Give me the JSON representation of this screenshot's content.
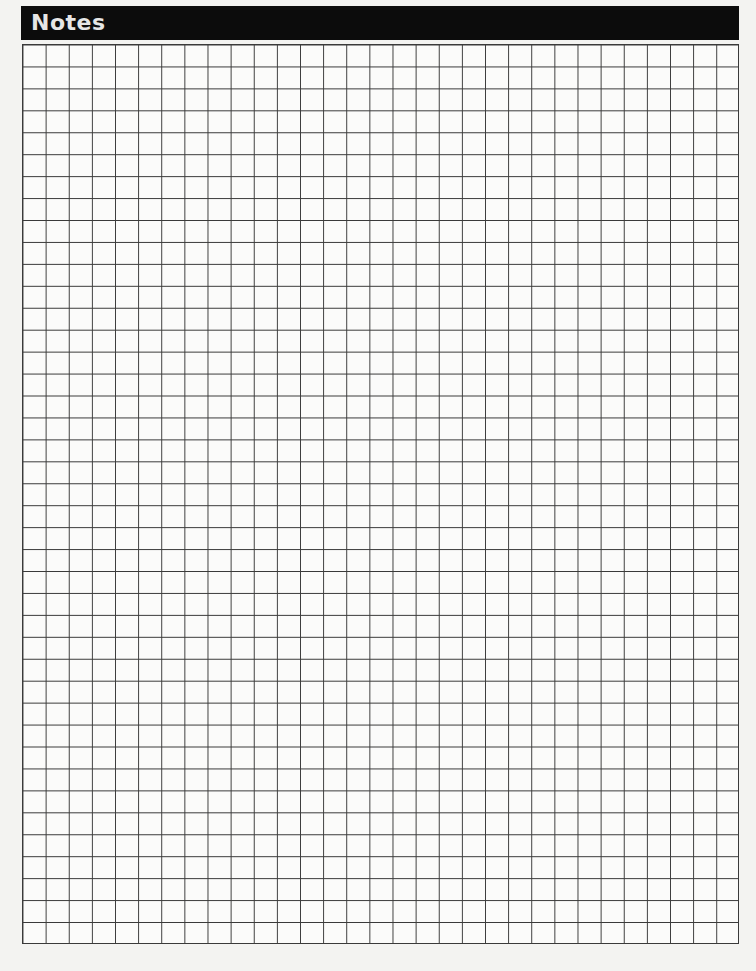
{
  "header": {
    "title": "Notes",
    "background_color": "#0c0c0c",
    "text_color": "#e6e6e6"
  },
  "grid": {
    "columns": 31,
    "rows": 41,
    "line_color": "#3a3a3a",
    "background_color": "#fbfbfa"
  }
}
